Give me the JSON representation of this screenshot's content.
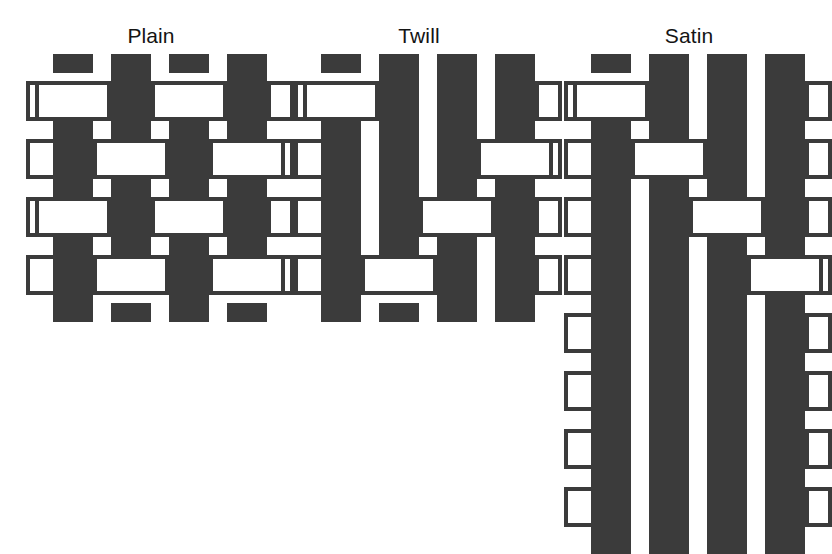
{
  "figure": {
    "background_color": "#ffffff",
    "thread_fill_color": "#3b3b3b",
    "thread_outline_color": "#3b3b3b",
    "thread_open_color": "#ffffff",
    "title_color": "#141414",
    "width": 831,
    "height": 542
  },
  "weaves": [
    {
      "id": "plain",
      "title": "Plain",
      "left": 26,
      "top": 24,
      "width": 250,
      "warp_count": 4,
      "weft_count": 4,
      "cell": 58,
      "thread": 40,
      "overhang": 18,
      "pattern_note": "1/1 checkerboard: warp up where (row + col) is even",
      "grid": [
        [
          0,
          1,
          0,
          1
        ],
        [
          1,
          0,
          1,
          0
        ],
        [
          0,
          1,
          0,
          1
        ],
        [
          1,
          0,
          1,
          0
        ]
      ]
    },
    {
      "id": "twill",
      "title": "Twill",
      "left": 294,
      "top": 24,
      "width": 250,
      "warp_count": 4,
      "weft_count": 4,
      "cell": 58,
      "thread": 40,
      "overhang": 18,
      "pattern_note": "3/1 twill: warp floats over three wefts then under one, stepping one thread per row",
      "grid": [
        [
          0,
          1,
          1,
          1
        ],
        [
          1,
          1,
          1,
          0
        ],
        [
          1,
          1,
          0,
          1
        ],
        [
          1,
          0,
          1,
          1
        ]
      ]
    },
    {
      "id": "satin",
      "title": "Satin",
      "left": 564,
      "top": 24,
      "width": 250,
      "warp_count": 4,
      "weft_count": 8,
      "cell": 58,
      "thread": 40,
      "overhang": 18,
      "pattern_note": "Satin: long warp floats, single interlacing scattered over an eight pick repeat",
      "grid": [
        [
          0,
          1,
          1,
          1
        ],
        [
          1,
          0,
          1,
          1
        ],
        [
          1,
          1,
          0,
          1
        ],
        [
          1,
          1,
          1,
          0
        ],
        [
          1,
          1,
          1,
          1
        ],
        [
          1,
          1,
          1,
          1
        ],
        [
          1,
          1,
          1,
          1
        ],
        [
          1,
          1,
          1,
          1
        ]
      ]
    }
  ],
  "legend": {
    "warp_label": "warp (vertical thread)",
    "weft_label": "weft (horizontal thread)",
    "warp_up_value": 1,
    "weft_up_value": 0
  }
}
